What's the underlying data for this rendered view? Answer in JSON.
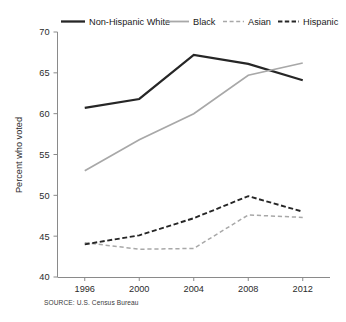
{
  "chart_data": {
    "type": "line",
    "title": "",
    "subtitle": "",
    "xlabel": "",
    "ylabel": "Percent who voted",
    "categories": [
      "1996",
      "2000",
      "2004",
      "2008",
      "2012"
    ],
    "x": [
      1996,
      2000,
      2004,
      2008,
      2012
    ],
    "xlim": [
      1994,
      2014
    ],
    "ylim": [
      40,
      70
    ],
    "yticks": [
      40,
      45,
      50,
      55,
      60,
      65,
      70
    ],
    "ytick_labels": [
      "40",
      "45",
      "50",
      "55",
      "60",
      "65",
      "70"
    ],
    "xticks": [
      1996,
      2000,
      2004,
      2008,
      2012
    ],
    "xtick_labels": [
      "1996",
      "2000",
      "2004",
      "2008",
      "2012"
    ],
    "grid": false,
    "legend_position": "top",
    "series": [
      {
        "name": "Non-Hispanic White",
        "values": [
          60.7,
          61.8,
          67.2,
          66.1,
          64.1
        ],
        "color": "#262626",
        "style": "solid",
        "width": 2.2
      },
      {
        "name": "Black",
        "values": [
          53.0,
          56.8,
          60.0,
          64.7,
          66.2
        ],
        "color": "#a8a8a8",
        "style": "solid",
        "width": 1.7
      },
      {
        "name": "Asian",
        "values": [
          44.2,
          43.4,
          43.5,
          47.6,
          47.3
        ],
        "color": "#a8a8a8",
        "style": "dashed",
        "width": 1.5
      },
      {
        "name": "Hispanic",
        "values": [
          44.0,
          45.1,
          47.2,
          49.9,
          48.0
        ],
        "color": "#262626",
        "style": "dashed",
        "width": 1.9
      }
    ],
    "source": "SOURCE: U.S. Census Bureau"
  },
  "legend": {
    "items": [
      {
        "label": "Non-Hispanic White"
      },
      {
        "label": "Black"
      },
      {
        "label": "Asian"
      },
      {
        "label": "Hispanic"
      }
    ]
  },
  "footer": {
    "source": "SOURCE: U.S. Census Bureau"
  }
}
